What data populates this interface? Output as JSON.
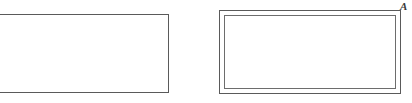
{
  "figure": {
    "background_color": "#ffffff",
    "line_color": "#5a5a5a",
    "inner_line_color": "#6d6d6d",
    "shapes": [
      {
        "name": "left-rectangle",
        "kind": "rectangle",
        "style": "single-outline",
        "cropped_at_left_edge": true,
        "x": -6,
        "y": 14,
        "width": 175,
        "height": 79,
        "fill": "#ffffff",
        "stroke": "#5a5a5a",
        "stroke_width": 1
      },
      {
        "name": "right-rectangle",
        "kind": "rectangle",
        "style": "double-outline",
        "cropped_at_left_edge": false,
        "x": 219,
        "y": 10,
        "width": 182,
        "height": 84,
        "inner_inset": 4,
        "fill": "#ffffff",
        "stroke": "#5a5a5a",
        "inner_stroke": "#6d6d6d",
        "stroke_width": 1
      }
    ],
    "labels": [
      {
        "name": "vertex-label-a",
        "text": "A",
        "style": "italic-serif",
        "anchor": "top-right-of-right-rectangle",
        "x": 400,
        "y": 0,
        "color": "#3a3a3a",
        "font_size": 11
      }
    ]
  }
}
